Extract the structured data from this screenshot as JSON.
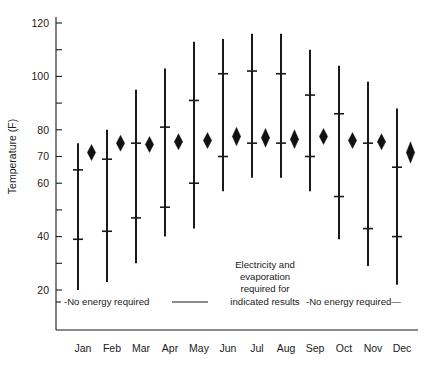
{
  "chart_data": {
    "type": "bar",
    "title": "",
    "xlabel": "",
    "ylabel": "Temperature (F)",
    "ylim": [
      10,
      122
    ],
    "grid": false,
    "legend": "none",
    "categories": [
      "Jan",
      "Feb",
      "Mar",
      "Apr",
      "May",
      "Jun",
      "Jul",
      "Aug",
      "Sep",
      "Oct",
      "Nov",
      "Dec"
    ],
    "y_ticks_labeled": [
      20,
      40,
      60,
      70,
      80,
      100,
      120
    ],
    "y_ticks_minor": [
      30,
      50,
      90,
      110
    ],
    "series": [
      {
        "name": "Range with quartile crossbars",
        "note": "Vertical bar spans min-max; two crossbars mark intermediate values",
        "values": [
          {
            "month": "Jan",
            "min": 20,
            "max": 75,
            "lower": 39,
            "upper": 65
          },
          {
            "month": "Feb",
            "min": 23,
            "max": 80,
            "lower": 42,
            "upper": 69
          },
          {
            "month": "Mar",
            "min": 30,
            "max": 95,
            "lower": 47,
            "upper": 75
          },
          {
            "month": "Apr",
            "min": 40,
            "max": 103,
            "lower": 51,
            "upper": 81
          },
          {
            "month": "May",
            "min": 43,
            "max": 113,
            "lower": 60,
            "upper": 91
          },
          {
            "month": "Jun",
            "min": 57,
            "max": 114,
            "lower": 70,
            "upper": 101
          },
          {
            "month": "Jul",
            "min": 62,
            "max": 116,
            "lower": 75,
            "upper": 102
          },
          {
            "month": "Aug",
            "min": 62,
            "max": 116,
            "lower": 75,
            "upper": 101
          },
          {
            "month": "Sep",
            "min": 57,
            "max": 110,
            "lower": 70,
            "upper": 93
          },
          {
            "month": "Oct",
            "min": 39,
            "max": 104,
            "lower": 55,
            "upper": 86
          },
          {
            "month": "Nov",
            "min": 29,
            "max": 98,
            "lower": 43,
            "upper": 75
          },
          {
            "month": "Dec",
            "min": 22,
            "max": 88,
            "lower": 40,
            "upper": 66
          }
        ]
      },
      {
        "name": "Diamond marker",
        "note": "Separate diamond symbol offset to the right of each range bar",
        "values": [
          {
            "month": "Jan",
            "center": 71.5,
            "low": 68.5,
            "high": 74.5
          },
          {
            "month": "Feb",
            "center": 75.0,
            "low": 72.0,
            "high": 78.0
          },
          {
            "month": "Mar",
            "center": 74.5,
            "low": 71.5,
            "high": 77.5
          },
          {
            "month": "Apr",
            "center": 75.5,
            "low": 72.5,
            "high": 78.5
          },
          {
            "month": "May",
            "center": 76.0,
            "low": 73.0,
            "high": 79.0
          },
          {
            "month": "Jun",
            "center": 77.5,
            "low": 74.0,
            "high": 81.0
          },
          {
            "month": "Jul",
            "center": 77.0,
            "low": 73.5,
            "high": 80.5
          },
          {
            "month": "Aug",
            "center": 76.5,
            "low": 73.0,
            "high": 80.0
          },
          {
            "month": "Sep",
            "center": 77.5,
            "low": 74.5,
            "high": 80.5
          },
          {
            "month": "Oct",
            "center": 76.0,
            "low": 73.0,
            "high": 79.0
          },
          {
            "month": "Nov",
            "center": 75.5,
            "low": 72.5,
            "high": 78.5
          },
          {
            "month": "Dec",
            "center": 71.5,
            "low": 67.5,
            "high": 75.5
          }
        ]
      }
    ],
    "annotations": [
      {
        "id": "left-no-energy",
        "text": "-No energy required",
        "trailing_rule": true
      },
      {
        "id": "center-note",
        "lines": [
          "Electricity and",
          "evaporation",
          "required for",
          "indicated results"
        ]
      },
      {
        "id": "right-no-energy",
        "text": "-No energy required—",
        "trailing_rule": false
      }
    ]
  },
  "axis": {
    "ylabel": "Temperature (F)"
  },
  "caption": {
    "text": ""
  }
}
